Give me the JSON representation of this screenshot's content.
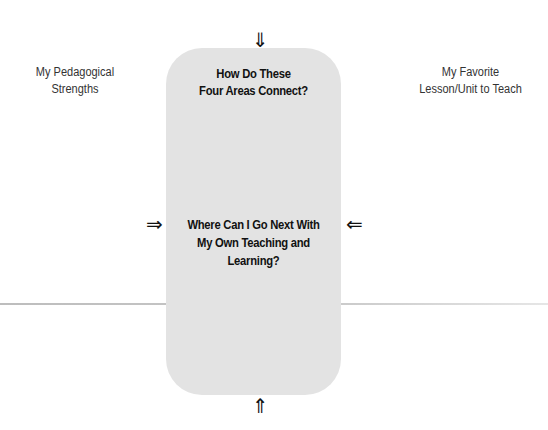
{
  "diagram": {
    "center_box": {
      "top_question": {
        "line1": "How Do These",
        "line2": "Four Areas Connect?"
      },
      "middle_question": {
        "line1": "Where Can I Go Next With",
        "line2": "My Own Teaching and",
        "line3": "Learning?"
      },
      "fill_color": "#e3e3e3"
    },
    "left_label": {
      "line1": "My Pedagogical",
      "line2": "Strengths"
    },
    "right_label": {
      "line1": "My Favorite",
      "line2": "Lesson/Unit to Teach"
    },
    "arrows": {
      "top": "⇓",
      "bottom": "⇑",
      "left": "⇒",
      "right": "⇐"
    }
  }
}
